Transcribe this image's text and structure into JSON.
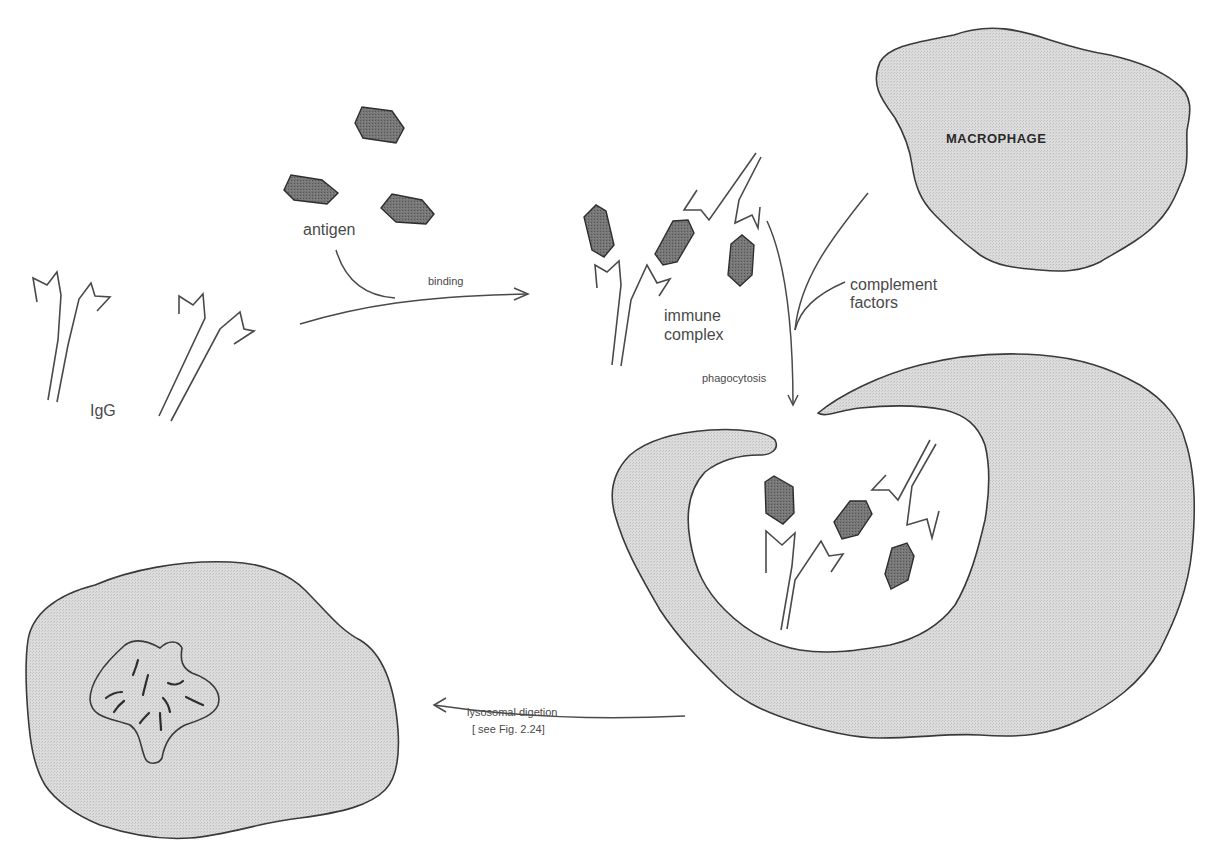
{
  "figure": {
    "labels": {
      "antigen": "antigen",
      "binding": "binding",
      "igg": "IgG",
      "macrophage": "MACROPHAGE",
      "immune_complex_line1": "immune",
      "immune_complex_line2": "complex",
      "complement_line1": "complement",
      "complement_line2": "factors",
      "phagocytosis": "phagocytosis",
      "lysosomal_digestion": "lysosomal  digetion",
      "see_fig": "[ see  Fig.  2.24]"
    },
    "colors": {
      "cell_fill": "#d6d6d6",
      "antigen_fill": "#6e6e6e",
      "outline": "#3a3a3a",
      "line": "#4a4a4a"
    },
    "stages": [
      "free IgG + antigen",
      "binding",
      "immune complex",
      "phagocytosis by macrophage",
      "lysosomal digestion"
    ]
  }
}
